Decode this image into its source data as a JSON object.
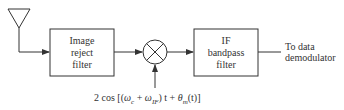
{
  "diagram": {
    "blocks": [
      {
        "id": "image-reject-filter",
        "lines": [
          "Image",
          "reject",
          "filter"
        ]
      },
      {
        "id": "if-bandpass-filter",
        "lines": [
          "IF",
          "bandpass",
          "filter"
        ]
      }
    ],
    "mixer": {
      "symbol": "multiplier"
    },
    "output_label": [
      "To data",
      "demodulator"
    ],
    "lo_signal": {
      "prefix": "2 cos [(",
      "omega": "ω",
      "sub_c": "c",
      "plus1": " + ",
      "sub_if": "IF",
      "mid": ") t + ",
      "theta": "θ",
      "sub_m": "m",
      "suffix": "(t)]"
    },
    "colors": {
      "stroke": "#333333",
      "background": "#ffffff"
    }
  }
}
